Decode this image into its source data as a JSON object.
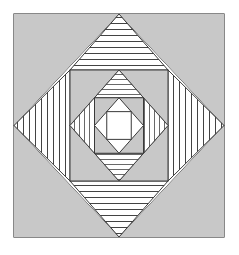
{
  "figure": {
    "title": "Nested diamond-in-square quilt block",
    "canvas": {
      "width": 239,
      "height": 255,
      "background": "#ffffff"
    },
    "colors": {
      "background": "#ffffff",
      "fill_gray": "#c8c8c8",
      "fill_white": "#ffffff",
      "stroke": "#3a3a3a",
      "hatch_line": "#2e2e2e"
    },
    "frame": {
      "label": "outer-square-frame",
      "x": 14,
      "y": 14,
      "width": 210,
      "height": 223,
      "fill": "#c8c8c8",
      "stroke_width": 1.2
    },
    "levels": [
      {
        "index": 0,
        "name": "level-1-outer",
        "square": {
          "x": 14,
          "y": 14,
          "width": 210,
          "height": 223
        },
        "diamond_label": "diamond-1",
        "corner_fill": "gray",
        "corner_pattern": "none"
      },
      {
        "index": 1,
        "name": "level-2",
        "square": {
          "x": 70,
          "y": 70,
          "width": 98,
          "height": 111
        },
        "diamond_label": "diamond-2",
        "corner_fill": "white",
        "corner_pattern": "hatched",
        "pattern_top_bottom": "horizontal-lines",
        "pattern_left_right": "vertical-lines"
      },
      {
        "index": 2,
        "name": "level-3",
        "square": {
          "x": 94,
          "y": 101,
          "width": 50,
          "height": 50
        },
        "diamond_label": "diamond-3",
        "corner_fill": "gray",
        "corner_pattern": "none"
      },
      {
        "index": 3,
        "name": "level-4",
        "square": {
          "x": 106,
          "y": 113,
          "width": 26,
          "height": 26
        },
        "diamond_label": "diamond-4",
        "corner_fill": "white",
        "corner_pattern": "hatched",
        "pattern_top_bottom": "horizontal-lines",
        "pattern_left_right": "vertical-lines"
      },
      {
        "index": 4,
        "name": "level-5-center",
        "square": {
          "x": 106,
          "y": 113,
          "width": 26,
          "height": 26
        },
        "diamond_label": "center-square",
        "corner_fill": "white",
        "corner_pattern": "none"
      }
    ],
    "hatch": {
      "horizontal_spacing": 6,
      "vertical_spacing": 6,
      "line_width": 0.9
    }
  }
}
